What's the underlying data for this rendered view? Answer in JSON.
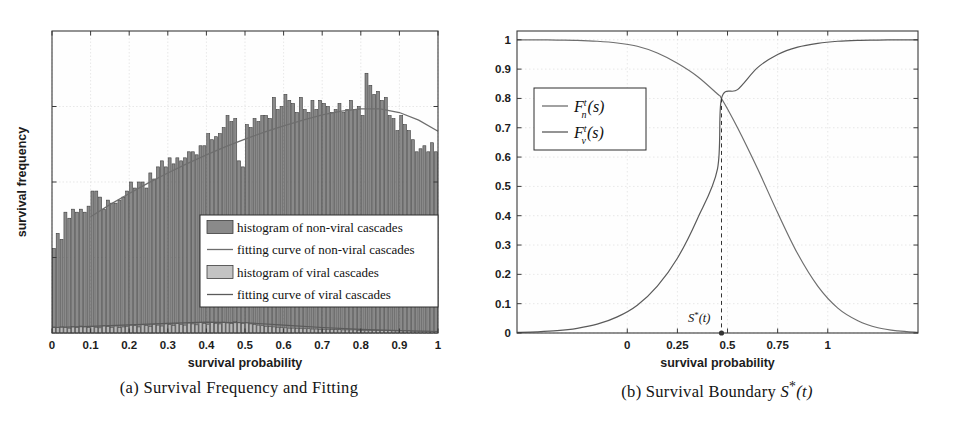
{
  "figure": {
    "subfigures": [
      {
        "key": "a",
        "caption": "(a) Survival Frequency and Fitting",
        "xlabel": "survival probability",
        "ylabel": "survival frequency"
      },
      {
        "key": "b",
        "caption_prefix": "(b) Survival Boundary ",
        "caption_math": "S*(t)",
        "xlabel": "survival probability"
      }
    ]
  },
  "colors": {
    "bar_nonviral_fill": "#8a8a8a",
    "bar_nonviral_edge": "#3d3d3d",
    "bar_viral_fill": "#b9b9b9",
    "bar_viral_edge": "#4a4a4a",
    "curve_nonviral": "#6e6e6e",
    "curve_viral": "#5a5a5a",
    "axis": "#3a3a3a",
    "grid": "#d8d8d8",
    "legend_bg": "#ffffff",
    "text": "#1c1c1c"
  },
  "panel_a": {
    "legend": [
      {
        "label": "histogram of non-viral cascades",
        "marker": "patch",
        "fill": "#8a8a8a"
      },
      {
        "label": "fitting curve of non-viral cascades",
        "marker": "line",
        "fill": "#6e6e6e"
      },
      {
        "label": "histogram of viral cascades",
        "marker": "patch",
        "fill": "#c3c3c3"
      },
      {
        "label": "fitting curve of viral cascades",
        "marker": "line",
        "fill": "#5a5a5a"
      }
    ]
  },
  "panel_b": {
    "legend": [
      {
        "label": "F_n^t(s)",
        "base": "F",
        "sub": "n",
        "sup": "t",
        "arg": "(s)"
      },
      {
        "label": "F_v^t(s)",
        "base": "F",
        "sub": "v",
        "sup": "t",
        "arg": "(s)"
      }
    ],
    "annotation": {
      "label": "S*(t)",
      "base": "S",
      "star": "*",
      "arg": "(t)"
    }
  },
  "chart_data": [
    {
      "type": "bar",
      "title": "(a) Survival Frequency and Fitting",
      "xlabel": "survival probability",
      "ylabel": "survival frequency",
      "xlim": [
        0,
        1
      ],
      "ylim": [
        0,
        1
      ],
      "grid": true,
      "xticks": [
        0,
        0.1,
        0.2,
        0.3,
        0.4,
        0.5,
        0.6,
        0.7,
        0.8,
        0.9,
        1
      ],
      "xticklabels": [
        "0",
        "0.1",
        "0.2",
        "0.3",
        "0.4",
        "0.5",
        "0.6",
        "0.7",
        "0.8",
        "0.9",
        "1"
      ],
      "yticks": [],
      "yticklabels": [],
      "bin_centers": [
        0.005,
        0.015,
        0.025,
        0.035,
        0.045,
        0.055,
        0.065,
        0.075,
        0.085,
        0.095,
        0.105,
        0.115,
        0.125,
        0.135,
        0.145,
        0.155,
        0.165,
        0.175,
        0.185,
        0.195,
        0.205,
        0.215,
        0.225,
        0.235,
        0.245,
        0.255,
        0.265,
        0.275,
        0.285,
        0.295,
        0.305,
        0.315,
        0.325,
        0.335,
        0.345,
        0.355,
        0.365,
        0.375,
        0.385,
        0.395,
        0.405,
        0.415,
        0.425,
        0.435,
        0.445,
        0.455,
        0.465,
        0.475,
        0.485,
        0.495,
        0.505,
        0.515,
        0.525,
        0.535,
        0.545,
        0.555,
        0.565,
        0.575,
        0.585,
        0.595,
        0.605,
        0.615,
        0.625,
        0.635,
        0.645,
        0.655,
        0.665,
        0.675,
        0.685,
        0.695,
        0.705,
        0.715,
        0.725,
        0.735,
        0.745,
        0.755,
        0.765,
        0.775,
        0.785,
        0.795,
        0.805,
        0.815,
        0.825,
        0.835,
        0.845,
        0.855,
        0.865,
        0.875,
        0.885,
        0.895,
        0.905,
        0.915,
        0.925,
        0.935,
        0.945,
        0.955,
        0.965,
        0.975,
        0.985,
        0.995
      ],
      "series": [
        {
          "name": "histogram of non-viral cascades",
          "kind": "bar",
          "values": [
            0.28,
            0.33,
            0.31,
            0.4,
            0.38,
            0.41,
            0.4,
            0.41,
            0.4,
            0.42,
            0.47,
            0.47,
            0.45,
            0.41,
            0.44,
            0.43,
            0.43,
            0.44,
            0.45,
            0.47,
            0.5,
            0.48,
            0.5,
            0.5,
            0.48,
            0.53,
            0.51,
            0.55,
            0.57,
            0.55,
            0.58,
            0.56,
            0.58,
            0.57,
            0.58,
            0.6,
            0.6,
            0.59,
            0.62,
            0.62,
            0.66,
            0.64,
            0.65,
            0.66,
            0.68,
            0.72,
            0.7,
            0.71,
            0.57,
            0.55,
            0.69,
            0.68,
            0.71,
            0.7,
            0.72,
            0.72,
            0.71,
            0.78,
            0.74,
            0.75,
            0.79,
            0.77,
            0.76,
            0.73,
            0.78,
            0.74,
            0.73,
            0.77,
            0.74,
            0.77,
            0.76,
            0.75,
            0.73,
            0.74,
            0.76,
            0.73,
            0.74,
            0.77,
            0.74,
            0.75,
            0.72,
            0.86,
            0.82,
            0.79,
            0.8,
            0.77,
            0.78,
            0.72,
            0.71,
            0.67,
            0.72,
            0.69,
            0.67,
            0.64,
            0.6,
            0.61,
            0.62,
            0.6,
            0.63,
            0.6
          ]
        },
        {
          "name": "histogram of viral cascades",
          "kind": "bar",
          "values": [
            0.02,
            0.018,
            0.022,
            0.019,
            0.016,
            0.021,
            0.018,
            0.023,
            0.02,
            0.018,
            0.022,
            0.019,
            0.017,
            0.024,
            0.021,
            0.019,
            0.023,
            0.018,
            0.02,
            0.022,
            0.026,
            0.024,
            0.02,
            0.027,
            0.025,
            0.022,
            0.029,
            0.026,
            0.023,
            0.03,
            0.028,
            0.025,
            0.031,
            0.028,
            0.026,
            0.033,
            0.03,
            0.027,
            0.034,
            0.031,
            0.029,
            0.035,
            0.032,
            0.03,
            0.036,
            0.033,
            0.031,
            0.038,
            0.034,
            0.032,
            0.035,
            0.03,
            0.028,
            0.026,
            0.024,
            0.022,
            0.021,
            0.02,
            0.019,
            0.018,
            0.017,
            0.016,
            0.016,
            0.015,
            0.015,
            0.014,
            0.014,
            0.013,
            0.013,
            0.012,
            0.012,
            0.012,
            0.011,
            0.011,
            0.011,
            0.01,
            0.01,
            0.01,
            0.01,
            0.009,
            0.009,
            0.009,
            0.009,
            0.008,
            0.008,
            0.008,
            0.008,
            0.008,
            0.007,
            0.007,
            0.007,
            0.007,
            0.007,
            0.006,
            0.006,
            0.006,
            0.006,
            0.006,
            0.005,
            0.005
          ]
        },
        {
          "name": "fitting curve of non-viral cascades",
          "kind": "line",
          "x": [
            0.1,
            0.15,
            0.2,
            0.25,
            0.3,
            0.35,
            0.4,
            0.45,
            0.5,
            0.55,
            0.6,
            0.65,
            0.7,
            0.75,
            0.8,
            0.85,
            0.9,
            0.95,
            1.0
          ],
          "values": [
            0.385,
            0.425,
            0.462,
            0.497,
            0.53,
            0.561,
            0.59,
            0.617,
            0.642,
            0.665,
            0.686,
            0.705,
            0.722,
            0.735,
            0.742,
            0.742,
            0.73,
            0.705,
            0.668
          ]
        },
        {
          "name": "fitting curve of viral cascades",
          "kind": "line",
          "x": [
            0.0,
            0.1,
            0.2,
            0.3,
            0.4,
            0.5,
            0.6,
            0.7,
            0.8,
            0.9,
            1.0
          ],
          "values": [
            0.018,
            0.022,
            0.027,
            0.032,
            0.036,
            0.034,
            0.026,
            0.018,
            0.012,
            0.008,
            0.005
          ]
        }
      ]
    },
    {
      "type": "line",
      "title": "(b) Survival Boundary S*(t)",
      "xlabel": "survival probability",
      "ylabel": "",
      "xlim": [
        -0.55,
        1.45
      ],
      "ylim": [
        0,
        1.03
      ],
      "grid": true,
      "xticks": [
        0,
        0.25,
        0.5,
        0.75,
        1
      ],
      "xticklabels": [
        "0",
        "0.25",
        "0.5",
        "0.75",
        "1"
      ],
      "yticks": [
        0,
        0.1,
        0.2,
        0.3,
        0.4,
        0.5,
        0.6,
        0.7,
        0.8,
        0.9,
        1
      ],
      "yticklabels": [
        "0",
        "0.1",
        "0.2",
        "0.3",
        "0.4",
        "0.5",
        "0.6",
        "0.7",
        "0.8",
        "0.9",
        "1"
      ],
      "series": [
        {
          "name": "F_n^t(s)",
          "kind": "line",
          "note": "decreasing sigmoid: starts near 1.0 at left, falls to ~0 at right",
          "x": [
            -0.55,
            -0.45,
            -0.35,
            -0.25,
            -0.15,
            -0.05,
            0.05,
            0.15,
            0.25,
            0.35,
            0.45,
            0.47,
            0.55,
            0.65,
            0.75,
            0.85,
            0.95,
            1.05,
            1.15,
            1.25,
            1.35,
            1.45
          ],
          "values": [
            1.0,
            1.0,
            0.999,
            0.998,
            0.995,
            0.989,
            0.978,
            0.955,
            0.92,
            0.875,
            0.815,
            0.8,
            0.7,
            0.56,
            0.41,
            0.27,
            0.16,
            0.085,
            0.042,
            0.018,
            0.007,
            0.002
          ]
        },
        {
          "name": "F_v^t(s)",
          "kind": "line",
          "note": "increasing sigmoid: starts near 0 at left, rises to ~1 at right",
          "x": [
            -0.55,
            -0.45,
            -0.35,
            -0.25,
            -0.15,
            -0.05,
            0.05,
            0.15,
            0.25,
            0.35,
            0.45,
            0.47,
            0.55,
            0.65,
            0.75,
            0.85,
            0.95,
            1.05,
            1.15,
            1.25,
            1.35,
            1.45
          ],
          "values": [
            0.002,
            0.004,
            0.008,
            0.016,
            0.03,
            0.055,
            0.095,
            0.16,
            0.255,
            0.39,
            0.56,
            0.8,
            0.83,
            0.905,
            0.95,
            0.975,
            0.988,
            0.995,
            0.998,
            0.999,
            1.0,
            1.0
          ]
        }
      ],
      "annotations": [
        {
          "label": "S*(t)",
          "x": 0.47,
          "y": 0.0,
          "type": "vertical-dashed-line-with-point",
          "cross_y": 0.8
        }
      ]
    }
  ]
}
